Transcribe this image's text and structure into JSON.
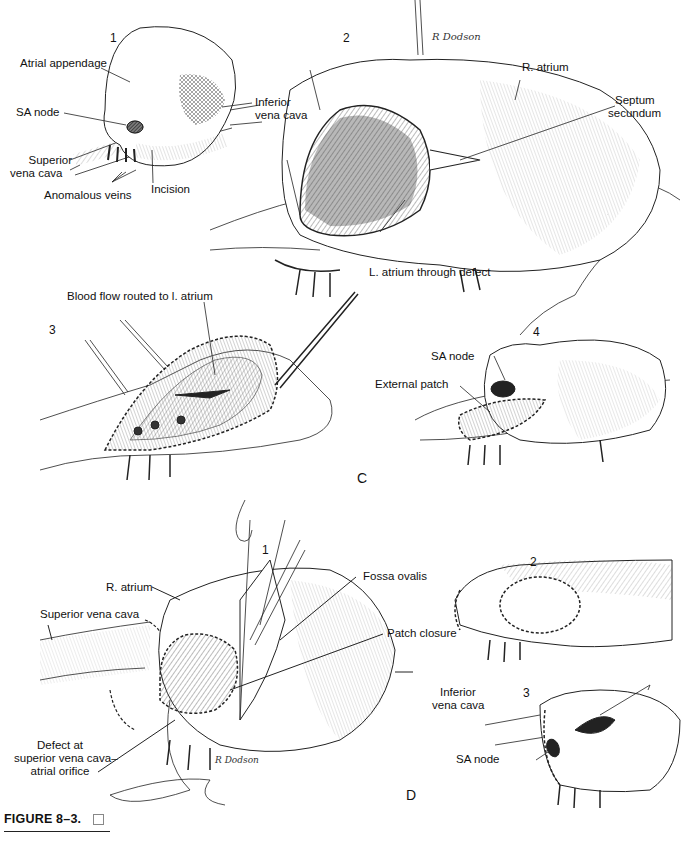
{
  "figure": {
    "caption": "FIGURE 8–3.",
    "signature": "R Dodson"
  },
  "panel_C": {
    "letter": "C",
    "sub1": {
      "number": "1",
      "labels": {
        "atrial_appendage": "Atrial appendage",
        "sa_node": "SA node",
        "superior_vena_cava_1": "Superior",
        "superior_vena_cava_2": "vena cava",
        "anomalous_veins": "Anomalous veins",
        "incision": "Incision",
        "inferior_vena_cava_1": "Inferior",
        "inferior_vena_cava_2": "vena cava"
      }
    },
    "sub2": {
      "number": "2",
      "labels": {
        "r_atrium": "R. atrium",
        "septum_secundum_1": "Septum",
        "septum_secundum_2": "secundum",
        "l_atrium": "L. atrium through defect"
      }
    },
    "sub3": {
      "number": "3",
      "labels": {
        "blood_flow": "Blood flow routed to l. atrium"
      }
    },
    "sub4": {
      "number": "4",
      "labels": {
        "sa_node": "SA node",
        "external_patch": "External patch"
      }
    }
  },
  "panel_D": {
    "letter": "D",
    "sub1": {
      "number": "1",
      "labels": {
        "r_atrium": "R. atrium",
        "superior_vena_cava": "Superior vena cava",
        "fossa_ovalis": "Fossa ovalis",
        "patch_closure": "Patch closure",
        "inferior_vena_cava_1": "Inferior",
        "inferior_vena_cava_2": "vena cava",
        "defect_1": "Defect at",
        "defect_2": "superior vena cava–",
        "defect_3": "atrial orifice"
      }
    },
    "sub2": {
      "number": "2"
    },
    "sub3": {
      "number": "3",
      "labels": {
        "sa_node": "SA node"
      }
    }
  }
}
